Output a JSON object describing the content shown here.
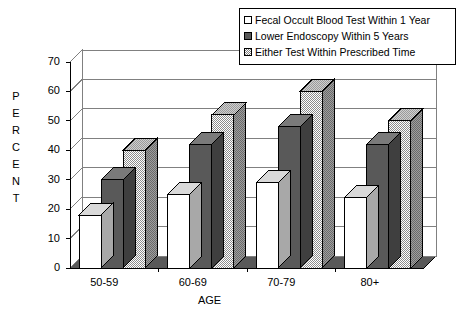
{
  "chart_data": {
    "type": "bar",
    "title": "",
    "subtitle": "",
    "xlabel": "AGE",
    "ylabel": "PERCENT",
    "ylim": [
      0,
      70
    ],
    "ytick_step": 10,
    "yticks": [
      0,
      10,
      20,
      30,
      40,
      50,
      60,
      70
    ],
    "grid": true,
    "grid_axis": "y",
    "legend_position": "top-right",
    "style": "3d-column",
    "categories": [
      "50-59",
      "60-69",
      "70-79",
      "80+"
    ],
    "series": [
      {
        "name": "Fecal Occult Blood Test Within 1 Year",
        "swatch": "white",
        "color": "#ffffff",
        "values": [
          18,
          25,
          29,
          24
        ]
      },
      {
        "name": "Lower Endoscopy Within 5 Years",
        "swatch": "dark",
        "color": "#595959",
        "values": [
          30,
          42,
          48,
          42
        ]
      },
      {
        "name": "Either Test Within Prescribed Time",
        "swatch": "checker",
        "color": "#b3b3b3",
        "values": [
          40,
          52,
          60,
          50
        ]
      }
    ]
  },
  "axes": {
    "y_title_letters": [
      "P",
      "E",
      "R",
      "C",
      "E",
      "N",
      "T"
    ],
    "x_title": "AGE"
  },
  "colors": {
    "background": "#ffffff",
    "axis": "#000000",
    "gridline": "#808080",
    "series_white": "#ffffff",
    "series_dark": "#595959",
    "series_checker": "#b3b3b3",
    "side_shade_white": "#b0b0b0",
    "side_shade_dark": "#3f3f3f",
    "side_shade_checker": "#6e6e6e",
    "floor": "#595959"
  }
}
